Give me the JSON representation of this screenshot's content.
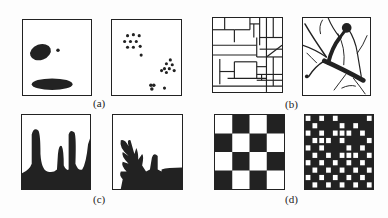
{
  "figure": {
    "groups": [
      {
        "id": "a",
        "label": "(a)",
        "panels": [
          "two dark blobs with small dot",
          "scattered dot clusters"
        ]
      },
      {
        "id": "b",
        "label": "(b)",
        "panels": [
          "rectilinear partition network",
          "branching dendritic structure"
        ]
      },
      {
        "id": "c",
        "label": "(c)",
        "panels": [
          "vertical columnar growths",
          "branched coral-like growth"
        ]
      },
      {
        "id": "d",
        "label": "(d)",
        "panels": [
          "coarse 4x4 checkerboard",
          "fine irregular checkerboard"
        ]
      }
    ]
  },
  "colors": {
    "ink": "#222222",
    "paper": "#ffffff"
  }
}
